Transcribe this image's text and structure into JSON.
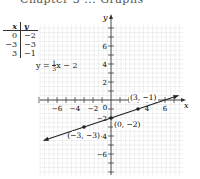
{
  "header": {
    "text": "Chapter 3 ... Graphs"
  },
  "table": {
    "headers": [
      "x",
      "y"
    ],
    "rows": [
      [
        "0",
        "−2"
      ],
      [
        "−3",
        "−3"
      ],
      [
        "3",
        "−1"
      ]
    ]
  },
  "equation": {
    "lhs": "y =",
    "num": "1",
    "den": "3",
    "rhs": "x − 2"
  },
  "chart_data": {
    "type": "line",
    "title": "",
    "xlabel": "x",
    "ylabel": "y",
    "xlim": [
      -8,
      8
    ],
    "ylim": [
      -8,
      8
    ],
    "grid": true,
    "x_ticks": [
      -6,
      -4,
      -2,
      2,
      4,
      6
    ],
    "y_ticks": [
      -6,
      -4,
      -2,
      2,
      4,
      6
    ],
    "x_tick_labels": [
      "−6",
      "−4",
      "−2",
      "4",
      "6"
    ],
    "y_tick_labels": [
      "6",
      "4",
      "2",
      "−2",
      "−4",
      "−6"
    ],
    "origin_label": "0",
    "series": [
      {
        "name": "y = 1/3 x − 2",
        "slope": 0.3333,
        "intercept": -2,
        "x": [
          -8,
          8
        ],
        "y": [
          -4.667,
          0.667
        ],
        "arrows": true
      }
    ],
    "points": [
      {
        "x": 0,
        "y": -2,
        "label": "(0, −2)"
      },
      {
        "x": -3,
        "y": -3,
        "label": "(−3, −3)"
      },
      {
        "x": 3,
        "y": -1,
        "label": "(3, −1)"
      }
    ],
    "colors": {
      "line": "#222222",
      "grid": "#d9d9d9",
      "axis": "#333333"
    }
  }
}
